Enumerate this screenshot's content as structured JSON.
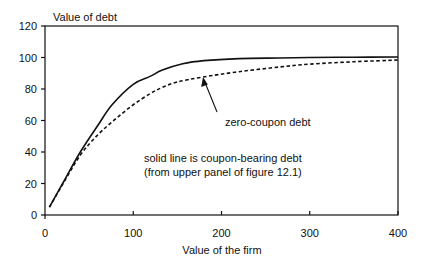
{
  "chart_data": {
    "type": "line",
    "title": "",
    "xlabel": "Value of the firm",
    "ylabel": "Value of debt",
    "xlim": [
      0,
      400
    ],
    "ylim": [
      0,
      120
    ],
    "x_ticks": [
      0,
      100,
      200,
      300,
      400
    ],
    "y_ticks": [
      0,
      20,
      40,
      60,
      80,
      100,
      120
    ],
    "grid": false,
    "legend": null,
    "series": [
      {
        "name": "coupon-bearing debt",
        "style": "solid",
        "color": "#111111",
        "x": [
          5,
          20,
          40,
          60,
          76,
          100,
          119,
          133,
          156,
          180,
          220,
          266,
          300,
          350,
          400
        ],
        "y": [
          5,
          20,
          40,
          57,
          70,
          83,
          88,
          92,
          96,
          98,
          99.3,
          99.7,
          100,
          100.2,
          100.3
        ]
      },
      {
        "name": "zero-coupon debt",
        "style": "dashed",
        "color": "#111111",
        "x": [
          5,
          20,
          40,
          60,
          80,
          100,
          119,
          133,
          150,
          179,
          220,
          266,
          300,
          350,
          400
        ],
        "y": [
          5,
          19.5,
          38,
          51,
          61,
          70,
          77,
          81,
          84.5,
          87.6,
          91,
          94,
          95.8,
          97.3,
          98.4
        ]
      }
    ],
    "annotations": [
      {
        "text": "zero-coupon debt",
        "arrow_from": [
          195,
          62
        ],
        "arrow_to": [
          179,
          87.6
        ]
      },
      {
        "text": "solid line is coupon-bearing debt"
      },
      {
        "text": "(from upper panel of figure 12.1)"
      }
    ]
  },
  "labels": {
    "y_title": "Value of debt",
    "x_title": "Value of the firm",
    "arrow_label": "zero-coupon debt",
    "note_line1": "solid line is coupon-bearing debt",
    "note_line2": "(from upper panel of figure 12.1)",
    "x_ticks": [
      "0",
      "100",
      "200",
      "300",
      "400"
    ],
    "y_ticks": [
      "0",
      "20",
      "40",
      "60",
      "80",
      "100",
      "120"
    ]
  }
}
